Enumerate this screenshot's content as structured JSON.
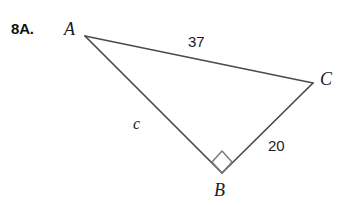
{
  "figure": {
    "problem_number": "8A.",
    "background_color": "#ffffff",
    "stroke_color": "#4a4a50",
    "text_color": "#1b1b1f",
    "vertices": [
      {
        "name": "A",
        "label": "A",
        "x": 85,
        "y": 36
      },
      {
        "name": "C",
        "label": "C",
        "x": 313,
        "y": 83
      },
      {
        "name": "B",
        "label": "B",
        "x": 222,
        "y": 173
      }
    ],
    "sides": [
      {
        "name": "AC",
        "label": "37",
        "from": "A",
        "to": "C",
        "type": "numeric"
      },
      {
        "name": "CB",
        "label": "20",
        "from": "C",
        "to": "B",
        "type": "numeric"
      },
      {
        "name": "AB",
        "label": "c",
        "from": "A",
        "to": "B",
        "type": "variable"
      }
    ],
    "right_angle": {
      "at_vertex": "B",
      "marker": "square",
      "description": "right-angle-marker"
    }
  }
}
